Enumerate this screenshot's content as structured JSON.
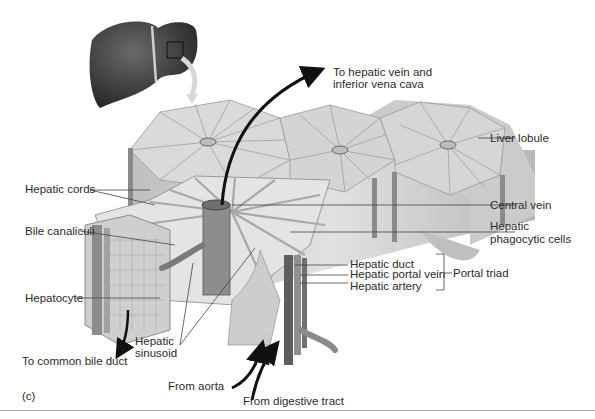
{
  "figure": {
    "panel_label": "(c)",
    "labels": {
      "to_hepatic_vein": [
        "To hepatic vein and",
        "inferior vena cava"
      ],
      "liver_lobule": "Liver lobule",
      "hepatic_cords": "Hepatic cords",
      "central_vein": "Central vein",
      "bile_canaliculi": "Bile canaliculi",
      "hepatic_phagocytic_cells": [
        "Hepatic",
        "phagocytic cells"
      ],
      "hepatic_duct": "Hepatic duct",
      "hepatic_portal_vein": "Hepatic portal vein",
      "hepatic_artery": "Hepatic artery",
      "portal_triad": "Portal triad",
      "hepatocyte": "Hepatocyte",
      "hepatic_sinusoid": [
        "Hepatic",
        "sinusoid"
      ],
      "to_common_bile_duct": "To common bile duct",
      "from_aorta": "From aorta",
      "from_digestive_tract": "From digestive tract"
    },
    "colors": {
      "liver_dark": "#3a3a3a",
      "lobule_face": "#d6d6d6",
      "lobule_side": "#c4c4c4",
      "vessel": "#7a7a7a",
      "leader_line": "#444444",
      "arrow": "#111111"
    }
  }
}
